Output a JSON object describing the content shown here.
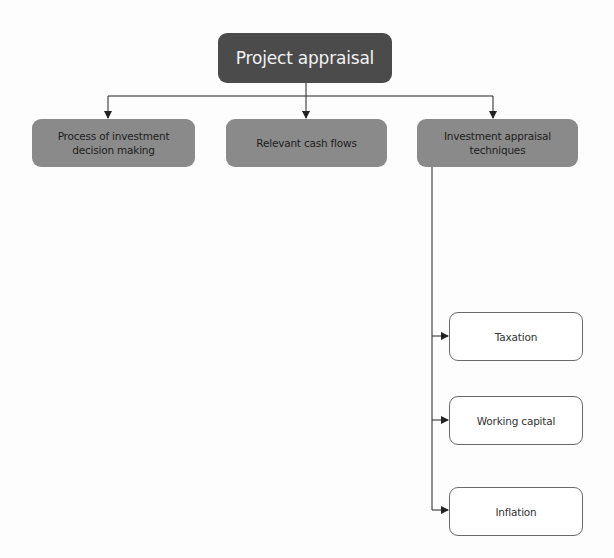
{
  "diagram": {
    "type": "hierarchy",
    "colors": {
      "root_fill": "#4b4b4b",
      "root_text": "#f2f2f2",
      "level1_fill": "#8a8a8a",
      "level1_text": "#1e1e1e",
      "level2_fill": "#ffffff",
      "level2_border": "#6a6a6a",
      "connector": "#222222"
    },
    "root": {
      "label": "Project appraisal"
    },
    "level1": [
      {
        "label": "Process of investment decision making"
      },
      {
        "label": "Relevant cash flows"
      },
      {
        "label": "Investment appraisal techniques"
      }
    ],
    "level2": {
      "parent": "Investment appraisal techniques",
      "items": [
        {
          "label": "Taxation"
        },
        {
          "label": "Working capital"
        },
        {
          "label": "Inflation"
        }
      ]
    },
    "edges": [
      {
        "from": "Project appraisal",
        "to": "Process of investment decision making"
      },
      {
        "from": "Project appraisal",
        "to": "Relevant cash flows"
      },
      {
        "from": "Project appraisal",
        "to": "Investment appraisal techniques"
      },
      {
        "from": "Investment appraisal techniques",
        "to": "Taxation"
      },
      {
        "from": "Investment appraisal techniques",
        "to": "Working capital"
      },
      {
        "from": "Investment appraisal techniques",
        "to": "Inflation"
      }
    ]
  }
}
